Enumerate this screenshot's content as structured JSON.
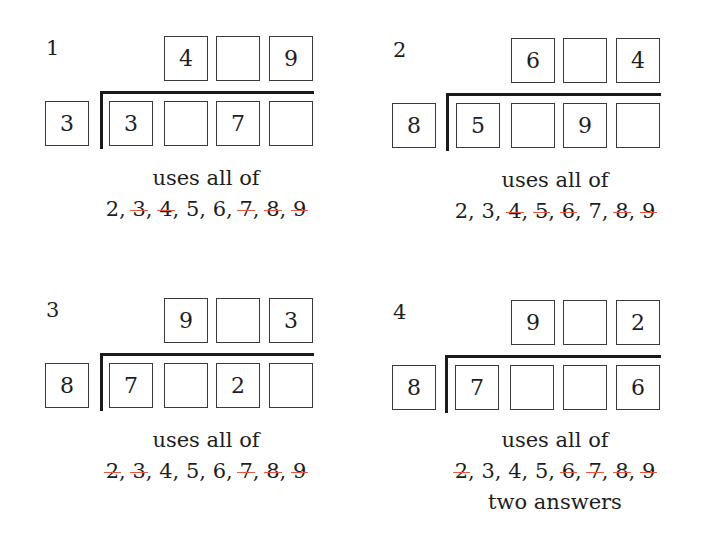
{
  "puzzles": [
    {
      "label": "1",
      "quotient": [
        "4",
        "",
        "9"
      ],
      "divisor": "3",
      "dividend": [
        "3",
        "",
        "7",
        ""
      ],
      "caption": "uses all of",
      "digits": [
        {
          "value": "2",
          "struck": false
        },
        {
          "value": "3",
          "struck": true
        },
        {
          "value": "4",
          "struck": true
        },
        {
          "value": "5",
          "struck": false
        },
        {
          "value": "6",
          "struck": false
        },
        {
          "value": "7",
          "struck": true
        },
        {
          "value": "8",
          "struck": true
        },
        {
          "value": "9",
          "struck": true
        }
      ],
      "note": ""
    },
    {
      "label": "2",
      "quotient": [
        "6",
        "",
        "4"
      ],
      "divisor": "8",
      "dividend": [
        "5",
        "",
        "9",
        ""
      ],
      "caption": "uses all of",
      "digits": [
        {
          "value": "2",
          "struck": false
        },
        {
          "value": "3",
          "struck": false
        },
        {
          "value": "4",
          "struck": true
        },
        {
          "value": "5",
          "struck": true
        },
        {
          "value": "6",
          "struck": true
        },
        {
          "value": "7",
          "struck": false
        },
        {
          "value": "8",
          "struck": true
        },
        {
          "value": "9",
          "struck": true
        }
      ],
      "note": ""
    },
    {
      "label": "3",
      "quotient": [
        "9",
        "",
        "3"
      ],
      "divisor": "8",
      "dividend": [
        "7",
        "",
        "2",
        ""
      ],
      "caption": "uses all of",
      "digits": [
        {
          "value": "2",
          "struck": true
        },
        {
          "value": "3",
          "struck": true
        },
        {
          "value": "4",
          "struck": false
        },
        {
          "value": "5",
          "struck": false
        },
        {
          "value": "6",
          "struck": false
        },
        {
          "value": "7",
          "struck": true
        },
        {
          "value": "8",
          "struck": true
        },
        {
          "value": "9",
          "struck": true
        }
      ],
      "note": ""
    },
    {
      "label": "4",
      "quotient": [
        "9",
        "",
        "2"
      ],
      "divisor": "8",
      "dividend": [
        "7",
        "",
        "",
        "6"
      ],
      "caption": "uses all of",
      "digits": [
        {
          "value": "2",
          "struck": true
        },
        {
          "value": "3",
          "struck": false
        },
        {
          "value": "4",
          "struck": false
        },
        {
          "value": "5",
          "struck": false
        },
        {
          "value": "6",
          "struck": true
        },
        {
          "value": "7",
          "struck": true
        },
        {
          "value": "8",
          "struck": true
        },
        {
          "value": "9",
          "struck": true
        }
      ],
      "note": "two answers"
    }
  ],
  "colors": {
    "strike": "#e8563f",
    "ink": "#1e1e1e",
    "box_border": "#3a3a3a"
  }
}
